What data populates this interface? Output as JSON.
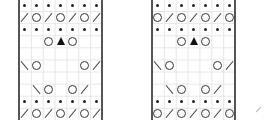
{
  "charts": [
    {
      "name": "knitting-chart-1",
      "rows": [
        [
          "dot",
          "dot",
          "dot",
          "dot",
          "dot",
          "dot",
          "dot"
        ],
        [
          "sl",
          "o",
          "sl",
          "o",
          "sl",
          "o",
          "sl"
        ],
        [
          "dot",
          "dot",
          "dot",
          "dot",
          "dot",
          "dot",
          "dot"
        ],
        [
          "",
          "",
          "o",
          "tri",
          "o",
          "",
          ""
        ],
        [
          "",
          "",
          "",
          "",
          "",
          "",
          ""
        ],
        [
          "bs",
          "o",
          "",
          "",
          "",
          "o",
          "sl"
        ],
        [
          "",
          "",
          "",
          "",
          "",
          "",
          ""
        ],
        [
          "",
          "bs",
          "o",
          "",
          "o",
          "sl",
          ""
        ],
        [
          "dot",
          "dot",
          "dot",
          "dot",
          "dot",
          "dot",
          "dot"
        ],
        [
          "sl",
          "o",
          "sl",
          "o",
          "sl",
          "o",
          "sl"
        ]
      ]
    },
    {
      "name": "knitting-chart-2",
      "rows": [
        [
          "dot",
          "dot",
          "dot",
          "dot",
          "dot",
          "dot",
          "dot"
        ],
        [
          "o",
          "sl",
          "o",
          "sl",
          "o",
          "sl",
          "o"
        ],
        [
          "dot",
          "dot",
          "dot",
          "dot",
          "dot",
          "dot",
          "dot"
        ],
        [
          "",
          "",
          "o",
          "tri",
          "o",
          "",
          ""
        ],
        [
          "",
          "",
          "",
          "",
          "",
          "",
          ""
        ],
        [
          "bs",
          "o",
          "",
          "",
          "",
          "o",
          "sl"
        ],
        [
          "",
          "",
          "",
          "",
          "",
          "",
          ""
        ],
        [
          "",
          "bs",
          "o",
          "",
          "o",
          "sl",
          ""
        ],
        [
          "dot",
          "dot",
          "dot",
          "dot",
          "dot",
          "dot",
          "dot"
        ],
        [
          "o",
          "sl",
          "o",
          "sl",
          "o",
          "sl",
          "o"
        ]
      ]
    }
  ],
  "legend": {
    "dot": "purl",
    "o": "yarn-over",
    "sl": "k2tog",
    "bs": "ssk",
    "tri": "centered-double-decrease"
  }
}
